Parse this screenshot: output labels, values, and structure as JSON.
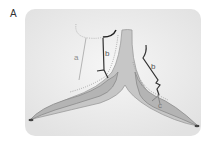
{
  "panel": {
    "label": "A"
  },
  "labels": {
    "a": "a",
    "b_left": "b",
    "b_right": "b",
    "c": "c"
  },
  "colors": {
    "background_panel": "#ececec",
    "tissue_fill": "#bdbdbd",
    "tissue_stroke": "#8a8a8a",
    "line_a": "#b0b0b0",
    "line_b": "#333333",
    "label_gray": "#8c8c8c",
    "label_dark": "#555555"
  }
}
